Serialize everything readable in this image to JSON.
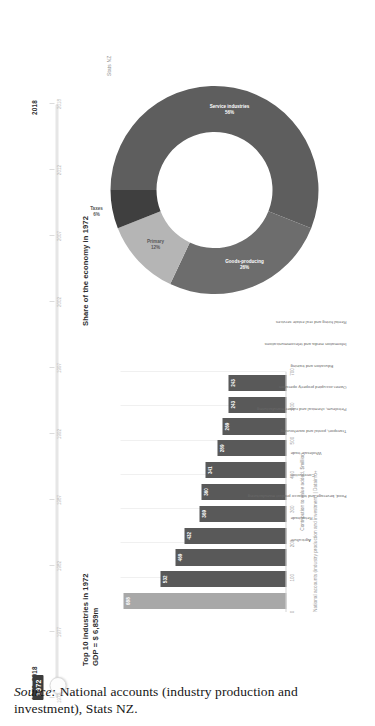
{
  "slider": {
    "range_label": "1972–2018",
    "end_label": "2018",
    "current_value": "1972",
    "ticks": [
      "1972",
      "1977",
      "1982",
      "1987",
      "1992",
      "1997",
      "2002",
      "2007",
      "2012",
      "2018"
    ]
  },
  "bar_panel": {
    "title_line1": "Top 10 industries in 1972",
    "title_line2": "GDP = $ 6,859m",
    "x_axis_title": "Contribution to value added, $million",
    "footnote": "National accounts (industry production and investment) | Datainfo+"
  },
  "donut_panel": {
    "title": "Share of the economy in 1972",
    "credit": "Stats NZ"
  },
  "caption": {
    "source_word": "Source:",
    "text": " National accounts (industry production and investment), Stats NZ."
  },
  "colors": {
    "bar_default": "#595959",
    "bar_highlight": "#a8a8a8",
    "donut_service": "#5e5e5e",
    "donut_goods": "#6d6d6d",
    "donut_primary": "#b5b5b5",
    "donut_taxes": "#3f3f3f",
    "badge": "#3c3c3c"
  },
  "chart_data": [
    {
      "type": "bar",
      "title": "Top 10 industries in 1972",
      "subtitle": "GDP = $ 6,859m",
      "xlabel": "Contribution to value added, $million",
      "ylabel": "",
      "orientation": "vertical",
      "xlim": [
        0,
        700
      ],
      "grid": true,
      "xticks": [
        0,
        100,
        200,
        300,
        400,
        500,
        600,
        700
      ],
      "categories": [
        "Agriculture",
        "Retail trade",
        "Food, beverage and tobacco product manufacturing",
        "Construction",
        "Wholesale trade",
        "Transport, postal and warehousing",
        "Petroleum, chemical and rubber manufacturing",
        "Owner-occupied property operation",
        "Education and training",
        "Information media and telecommunications",
        "Rental hiring and real estate services"
      ],
      "values": [
        688,
        532,
        469,
        432,
        369,
        360,
        341,
        289,
        269,
        243,
        243
      ],
      "highlight_index": 0
    },
    {
      "type": "pie",
      "variant": "donut",
      "title": "Share of the economy in 1972",
      "labels": [
        "Service industries",
        "Goods-producing",
        "Primary",
        "Taxes"
      ],
      "values": [
        56,
        26,
        12,
        6
      ],
      "display_percents": [
        "56%",
        "26%",
        "12%",
        "6%"
      ],
      "colors": [
        "#5e5e5e",
        "#6d6d6d",
        "#b5b5b5",
        "#3f3f3f"
      ],
      "legend": "none"
    }
  ]
}
